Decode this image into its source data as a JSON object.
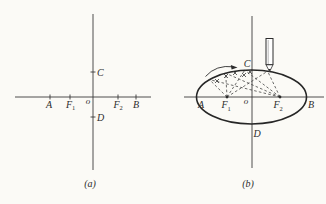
{
  "colors": {
    "paper": "#fbfaf6",
    "ink": "#2c2c2c",
    "axis": "#3b3b3b"
  },
  "icons": {
    "pencil": "pencil-icon",
    "rotation_arrow": "rotation-arrow-icon"
  },
  "panel_a": {
    "caption": "(a)",
    "labels": {
      "A": "A",
      "F1_base": "F",
      "F1_sub": "1",
      "o": "o",
      "F2_base": "F",
      "F2_sub": "2",
      "B": "B",
      "C": "C",
      "D": "D"
    }
  },
  "panel_b": {
    "caption": "(b)",
    "labels": {
      "A": "A",
      "F1_base": "F",
      "F1_sub": "1",
      "o": "o",
      "F2_base": "F",
      "F2_sub": "2",
      "B": "B",
      "C": "C",
      "D": "D"
    }
  }
}
